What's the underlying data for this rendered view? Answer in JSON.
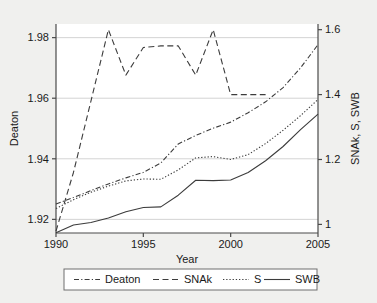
{
  "chart_data": {
    "type": "line",
    "title": "",
    "xlabel": "Year",
    "ylabel_left": "Deaton",
    "ylabel_right": "SNAk, S, SWB",
    "xlim": [
      1990,
      2005
    ],
    "ylim_left": [
      1.9155,
      1.9845
    ],
    "ylim_right": [
      0.9735,
      1.6175
    ],
    "xticks": [
      1990,
      1995,
      2000,
      2005
    ],
    "xtick_labels": [
      "1990",
      "1995",
      "2000",
      "2005"
    ],
    "yticks_left": [
      1.92,
      1.94,
      1.96,
      1.98
    ],
    "ytick_labels_left": [
      "1.92",
      "1.94",
      "1.96",
      "1.98"
    ],
    "yticks_right": [
      1.0,
      1.2,
      1.4,
      1.6
    ],
    "ytick_labels_right": [
      "1",
      "1.2",
      "1.4",
      "1.6"
    ],
    "grid": "horizontal",
    "legend_position": "below",
    "x": [
      1990,
      1991,
      1992,
      1993,
      1994,
      1995,
      1996,
      1997,
      1998,
      1999,
      2000,
      2001,
      2002,
      2003,
      2004,
      2005
    ],
    "series": [
      {
        "name": "Deaton",
        "axis": "left",
        "style": "dash-dot",
        "values": [
          1.9251,
          1.9272,
          1.9295,
          1.9317,
          1.9337,
          1.9355,
          1.9386,
          1.9449,
          1.9477,
          1.9501,
          1.9521,
          1.9552,
          1.9588,
          1.9635,
          1.97,
          1.9777
        ]
      },
      {
        "name": "SNAk",
        "axis": "right",
        "style": "long-dash",
        "values": [
          0.9795,
          1.16,
          1.38,
          1.6,
          1.46,
          1.545,
          1.55,
          1.55,
          1.46,
          1.6,
          1.4,
          1.4,
          1.4,
          null,
          null,
          null
        ]
      },
      {
        "name": "S",
        "axis": "right",
        "style": "dotted",
        "values": [
          1.049,
          1.076,
          1.099,
          1.118,
          1.134,
          1.14,
          1.139,
          1.168,
          1.205,
          1.209,
          1.2,
          1.215,
          1.249,
          1.29,
          1.335,
          1.385
        ]
      },
      {
        "name": "SWB",
        "axis": "right",
        "style": "solid",
        "values": [
          0.974,
          0.998,
          1.006,
          1.02,
          1.039,
          1.052,
          1.054,
          1.09,
          1.136,
          1.135,
          1.137,
          1.16,
          1.196,
          1.24,
          1.292,
          1.34
        ]
      }
    ],
    "legend_entries": [
      {
        "label": "Deaton",
        "style": "dash-dot"
      },
      {
        "label": "SNAk",
        "style": "long-dash"
      },
      {
        "label": "S",
        "style": "dotted"
      },
      {
        "label": "SWB",
        "style": "solid"
      }
    ]
  },
  "colors": {
    "background": "#f0f0ee",
    "plot_background": "#ffffff",
    "axis": "#4a4a4a",
    "grid": "#c8c8c8",
    "line": "#3c3c3c",
    "text": "#1a1a1a",
    "legend_border": "#6e6e6e"
  }
}
